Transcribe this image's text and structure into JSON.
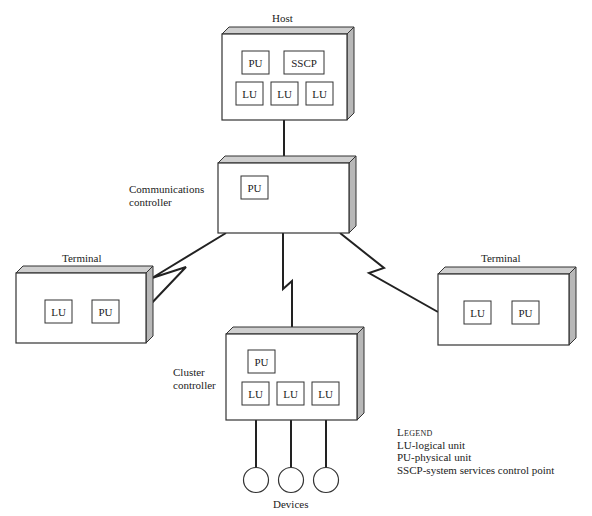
{
  "diagram": {
    "colors": {
      "line": "#222222",
      "box_fill": "#ffffff",
      "box_side": "#b8b8b8",
      "box_top": "#cfcfcf"
    },
    "nodes": [
      {
        "id": "host",
        "label": "Host",
        "units": [
          "PU",
          "SSCP",
          "LU",
          "LU",
          "LU"
        ]
      },
      {
        "id": "comms",
        "label": "Communications controller",
        "label_lines": [
          "Communications",
          "controller"
        ],
        "units": [
          "PU"
        ]
      },
      {
        "id": "term_left",
        "label": "Terminal",
        "units": [
          "LU",
          "PU"
        ]
      },
      {
        "id": "term_right",
        "label": "Terminal",
        "units": [
          "LU",
          "PU"
        ]
      },
      {
        "id": "cluster",
        "label": "Cluster controller",
        "label_lines": [
          "Cluster",
          "controller"
        ],
        "units": [
          "PU",
          "LU",
          "LU",
          "LU"
        ]
      },
      {
        "id": "devices",
        "label": "Devices",
        "count": 3
      }
    ],
    "edges": [
      {
        "from": "host",
        "to": "comms",
        "type": "solid"
      },
      {
        "from": "comms",
        "to": "term_left",
        "type": "zigzag"
      },
      {
        "from": "comms",
        "to": "cluster",
        "type": "zigzag"
      },
      {
        "from": "comms",
        "to": "term_right",
        "type": "zigzag"
      },
      {
        "from": "cluster",
        "to": "devices",
        "type": "solid",
        "count": 3
      }
    ]
  },
  "labels": {
    "host": "Host",
    "comms_line1": "Communications",
    "comms_line2": "controller",
    "term_left": "Terminal",
    "term_right": "Terminal",
    "cluster_line1": "Cluster",
    "cluster_line2": "controller",
    "devices": "Devices"
  },
  "units": {
    "host": [
      "PU",
      "SSCP",
      "LU",
      "LU",
      "LU"
    ],
    "comms": [
      "PU"
    ],
    "term_left": [
      "LU",
      "PU"
    ],
    "term_right": [
      "LU",
      "PU"
    ],
    "cluster": [
      "PU",
      "LU",
      "LU",
      "LU"
    ]
  },
  "legend": {
    "title": "Legend",
    "items": [
      "LU-logical unit",
      "PU-physical unit",
      "SSCP-system services control point"
    ]
  }
}
